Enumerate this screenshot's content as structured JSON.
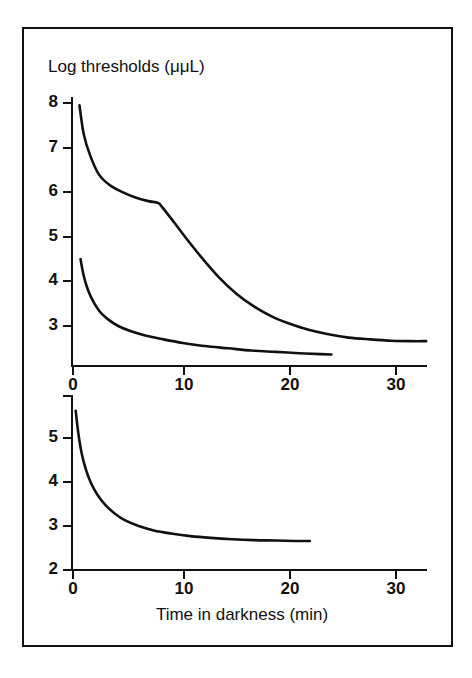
{
  "figure": {
    "border_color": "#111111",
    "background_color": "#ffffff",
    "line_color": "#111111"
  },
  "labels": {
    "y_axis_title": "Log thresholds (μμL)",
    "x_axis_title": "Time in darkness (min)"
  },
  "top_panel": {
    "y_ticks": [
      "8",
      "7",
      "6",
      "5",
      "4",
      "3"
    ],
    "x_ticks": [
      "0",
      "10",
      "20",
      "30"
    ]
  },
  "bottom_panel": {
    "y_ticks": [
      "5",
      "4",
      "3",
      "2"
    ],
    "x_ticks": [
      "0",
      "10",
      "20",
      "30"
    ]
  },
  "chart_data": {
    "type": "line",
    "title": "Log thresholds (μμL)",
    "xlabel": "Time in darkness (min)",
    "ylabel": "Log thresholds (μμL)",
    "panels": [
      {
        "name": "top-panel",
        "xlim": [
          0,
          33
        ],
        "ylim": [
          2.3,
          8.2
        ],
        "x_ticks": [
          0,
          10,
          20,
          30
        ],
        "y_ticks": [
          3,
          4,
          5,
          6,
          7,
          8
        ],
        "grid": false,
        "legend": "none",
        "annotations": [
          {
            "label": "rod-cone break",
            "x": 8.3,
            "y": 5.7
          }
        ],
        "series": [
          {
            "name": "Rod-cone dark adaptation curve (biphasic)",
            "x": [
              0.6,
              1.0,
              1.6,
              2.4,
              3.4,
              4.6,
              5.8,
              7.0,
              7.9,
              8.3,
              9.4,
              10.6,
              12.0,
              13.6,
              15.2,
              16.8,
              18.4,
              20.0,
              21.8,
              23.6,
              25.6,
              27.6,
              29.6,
              31.4,
              32.8
            ],
            "y": [
              7.95,
              7.3,
              6.82,
              6.4,
              6.16,
              6.0,
              5.88,
              5.8,
              5.76,
              5.66,
              5.32,
              4.94,
              4.52,
              4.08,
              3.72,
              3.44,
              3.22,
              3.06,
              2.92,
              2.82,
              2.74,
              2.7,
              2.67,
              2.66,
              2.66
            ]
          },
          {
            "name": "Cone-only dark adaptation curve",
            "x": [
              0.7,
              1.0,
              1.4,
              1.9,
              2.5,
              3.2,
              4.2,
              5.4,
              6.8,
              8.4,
              10.2,
              12.2,
              14.4,
              16.6,
              18.8,
              21.0,
              23.0,
              24.0
            ],
            "y": [
              4.5,
              4.12,
              3.8,
              3.54,
              3.32,
              3.16,
              3.0,
              2.88,
              2.78,
              2.7,
              2.62,
              2.55,
              2.5,
              2.45,
              2.42,
              2.39,
              2.37,
              2.36
            ]
          }
        ]
      },
      {
        "name": "bottom-panel",
        "xlim": [
          0,
          33
        ],
        "ylim": [
          2.0,
          5.9
        ],
        "x_ticks": [
          0,
          10,
          20,
          30
        ],
        "y_ticks": [
          2,
          3,
          4,
          5
        ],
        "grid": false,
        "legend": "none",
        "annotations": [],
        "series": [
          {
            "name": "Cone dark adaptation curve (monophasic)",
            "x": [
              0.25,
              0.5,
              0.8,
              1.2,
              1.7,
              2.3,
              3.0,
              3.9,
              4.9,
              6.1,
              7.5,
              9.1,
              10.9,
              12.8,
              14.8,
              16.8,
              18.8,
              20.6,
              22.0
            ],
            "y": [
              5.62,
              5.1,
              4.66,
              4.28,
              3.96,
              3.7,
              3.48,
              3.28,
              3.12,
              3.0,
              2.9,
              2.83,
              2.77,
              2.73,
              2.7,
              2.68,
              2.67,
              2.66,
              2.66
            ]
          }
        ]
      }
    ]
  }
}
